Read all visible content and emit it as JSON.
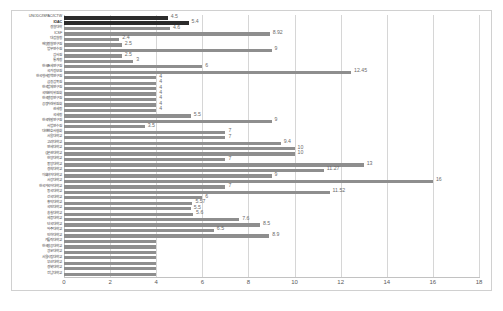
{
  "chart_data": {
    "type": "bar",
    "orientation": "horizontal",
    "title": "",
    "xlabel": "",
    "ylabel": "",
    "xlim": [
      0,
      18
    ],
    "xticks": [
      0,
      2,
      4,
      6,
      8,
      10,
      12,
      14,
      16,
      18
    ],
    "grid": true,
    "legend": "none",
    "colors": {
      "bar_default": "#8e8e8e",
      "bar_highlight": "#2c2c2c",
      "gridline": "#d6d6d6",
      "frame": "#d0d0d0",
      "label": "#4a4a4a",
      "value_label": "#6b6b6b"
    },
    "categories": [
      "UNODC/ISPAC/ICTW",
      "IOAC",
      "경찰대학",
      "ICSF",
      "대검찰청",
      "해양경찰연구원",
      "법무연수원",
      "감사원",
      "통계청",
      "한국조세연구원",
      "국가정보원",
      "한국형사정책연구원",
      "금융감독원",
      "한국법제연구원",
      "국민권익위원회",
      "한국행정연구원",
      "공정거래위원회",
      "관세청",
      "국세청",
      "한국개발연구원",
      "사법연수원",
      "대한변호사협회",
      "서울대학교",
      "고려대학교",
      "연세대학교",
      "성균관대학교",
      "한양대학교",
      "중앙대학교",
      "경희대학교",
      "이화여자대학교",
      "서강대학교",
      "한국외국어대학교",
      "동국대학교",
      "건국대학교",
      "홍익대학교",
      "국민대학교",
      "숭실대학교",
      "세종대학교",
      "단국대학교",
      "아주대학교",
      "인하대학교",
      "가톨릭대학교",
      "한국항공대학교",
      "광운대학교",
      "서울시립대학교",
      "부산대학교",
      "경북대학교",
      "전남대학교"
    ],
    "values": [
      4.5,
      5.4,
      4.6,
      8.92,
      2.4,
      2.5,
      9,
      2.5,
      3,
      6,
      12.45,
      4,
      4,
      4,
      4,
      4,
      4,
      4,
      5.5,
      9,
      3.5,
      7,
      7,
      9.4,
      10,
      10,
      7,
      13,
      11.27,
      9,
      16,
      7,
      11.52,
      6,
      5.57,
      5.5,
      5.6,
      7.6,
      8.5,
      6.5,
      8.9,
      4,
      4,
      4,
      4,
      4,
      4,
      4
    ],
    "value_labels": [
      "4.5",
      "5.4",
      "4.6",
      "8.92",
      "2.4",
      "2.5",
      "9",
      "2.5",
      "3",
      "6",
      "12.45",
      "4",
      "4",
      "4",
      "4",
      "4",
      "4",
      "4",
      "5.5",
      "9",
      "3.5",
      "7",
      "7",
      "9.4",
      "10",
      "10",
      "7",
      "13",
      "11.27",
      "9",
      "16",
      "7",
      "11.52",
      "6",
      "5.57",
      "5.5",
      "5.6",
      "7.6",
      "8.5",
      "6.5",
      "8.9",
      "",
      "",
      "",
      "",
      "",
      "",
      ""
    ],
    "highlighted_indices": [
      0,
      1
    ]
  }
}
